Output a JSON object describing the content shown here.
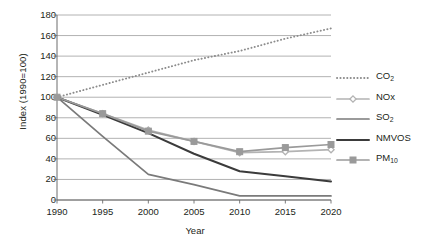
{
  "chart_data": {
    "type": "line",
    "title": "",
    "xlabel": "Year",
    "ylabel": "Index (1990=100)",
    "x": [
      1990,
      1995,
      2000,
      2005,
      2010,
      2015,
      2020
    ],
    "xlim": [
      1990,
      2020
    ],
    "ylim": [
      0,
      180
    ],
    "yticks": [
      0,
      20,
      40,
      60,
      80,
      100,
      120,
      140,
      160,
      180
    ],
    "xticks": [
      1990,
      1995,
      2000,
      2005,
      2010,
      2015,
      2020
    ],
    "grid": "horizontal",
    "legend_position": "right",
    "series": [
      {
        "name": "CO2",
        "label_main": "CO",
        "label_sub": "2",
        "style": "dotted",
        "marker": "none",
        "color": "#8c8c8c",
        "values": [
          100,
          112,
          124,
          136,
          145,
          157,
          167
        ]
      },
      {
        "name": "NOx",
        "label_main": "NOx",
        "label_sub": "",
        "style": "solid",
        "marker": "diamond",
        "color": "#b3b3b3",
        "values": [
          100,
          84,
          68,
          57,
          46,
          47,
          49
        ]
      },
      {
        "name": "SO2",
        "label_main": "SO",
        "label_sub": "2",
        "style": "solid",
        "marker": "none",
        "color": "#7a7a7a",
        "values": [
          100,
          62,
          25,
          15,
          4,
          4,
          4
        ]
      },
      {
        "name": "NMVOS",
        "label_main": "NMVOS",
        "label_sub": "",
        "style": "solid",
        "marker": "none",
        "color": "#3b3b3b",
        "values": [
          100,
          83,
          65,
          45,
          28,
          23,
          18
        ]
      },
      {
        "name": "PM10",
        "label_main": "PM",
        "label_sub": "10",
        "style": "solid",
        "marker": "square",
        "color": "#9a9a9a",
        "values": [
          100,
          84,
          67,
          57,
          47,
          51,
          54
        ]
      }
    ],
    "colors": {
      "axis": "#6d6d6d",
      "grid": "#9e9e9e",
      "text": "#231f20",
      "background": "#ffffff"
    }
  }
}
